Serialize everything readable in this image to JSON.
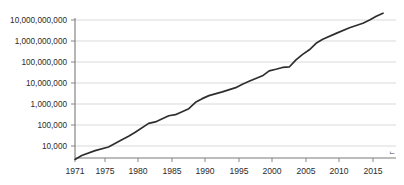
{
  "chart_data": {
    "type": "line",
    "title": "",
    "subtitle": "",
    "xlabel": "",
    "ylabel": "",
    "yscale": "log",
    "xlim": [
      1971,
      2017
    ],
    "ylim": [
      2300,
      30000000000
    ],
    "grid": true,
    "legend": null,
    "legend_position": "none",
    "colors": {
      "line": "#2e2e2e",
      "grid": "#cfcfcf",
      "axis": "#7a7a7a",
      "background": "#ffffff",
      "text": "#2b2b2b"
    },
    "y_tick_labels": [
      "10,000",
      "100,000",
      "1,000,000",
      "10,000,000",
      "100,000,000",
      "1,000,000,000",
      "10,000,000,000"
    ],
    "y_tick_values": [
      10000,
      100000,
      1000000,
      10000000,
      100000000,
      1000000000,
      10000000000
    ],
    "x_tick_labels": [
      "1971",
      "1975",
      "1980",
      "1985",
      "1990",
      "1995",
      "2000",
      "2005",
      "2010",
      "2015"
    ],
    "x_tick_values": [
      1971,
      1975,
      1980,
      1985,
      1990,
      1995,
      2000,
      2005,
      2010,
      2015
    ],
    "series": [
      {
        "name": "Transistor count",
        "x": [
          1971,
          1972,
          1974,
          1976,
          1978,
          1979,
          1980,
          1982,
          1983,
          1985,
          1986,
          1988,
          1989,
          1990,
          1991,
          1993,
          1995,
          1996,
          1997,
          1999,
          2000,
          2001,
          2002,
          2003,
          2004,
          2005,
          2006,
          2007,
          2008,
          2010,
          2012,
          2014,
          2015,
          2016,
          2017
        ],
        "y": [
          2300,
          3500,
          6000,
          9000,
          20000,
          29000,
          45000,
          120000,
          140000,
          275000,
          310000,
          600000,
          1200000,
          1800000,
          2500000,
          3800000,
          6000000,
          8800000,
          12000000,
          22000000,
          38000000,
          45000000,
          55000000,
          58000000,
          125000000,
          230000000,
          380000000,
          780000000,
          1200000000,
          2300000000,
          4300000000,
          7000000000,
          10000000000,
          15000000000,
          21000000000
        ]
      }
    ],
    "annotations": [
      {
        "name": "axis-corner-glyph",
        "text": "ᄂ"
      }
    ]
  }
}
